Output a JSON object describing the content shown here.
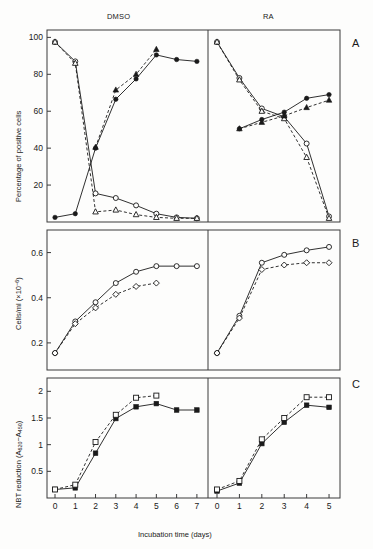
{
  "figure": {
    "columns": [
      {
        "id": "dmso",
        "label": "DMSO"
      },
      {
        "id": "ra",
        "label": "RA"
      }
    ],
    "panel_letters": [
      "A",
      "B",
      "C"
    ],
    "xlabel": "Incubation time (days)",
    "panels": [
      {
        "letter": "A",
        "ylabel": "Percentage of positive cells",
        "yticks": [
          20,
          40,
          60,
          80,
          100
        ]
      },
      {
        "letter": "B",
        "ylabel_main": "Cells/ml",
        "ylabel_unit_base": "(×10",
        "ylabel_unit_exp": "−6",
        "ylabel_unit_close": ")",
        "yticks": [
          0.2,
          0.4,
          0.6
        ]
      },
      {
        "letter": "C",
        "ylabel_main": "NBT reduction (A",
        "ylabel_sub1": "620",
        "ylabel_mid": "−A",
        "ylabel_sub2": "450",
        "ylabel_close": ")",
        "yticks": [
          0.5,
          1.0,
          1.5,
          2.0
        ]
      }
    ]
  },
  "chart_data": [
    {
      "id": "panel-a-dmso",
      "type": "line",
      "title": "DMSO",
      "panel": "A",
      "xlabel": "Incubation time (days)",
      "ylabel": "Percentage of positive cells",
      "xlim": [
        0,
        7.4
      ],
      "ylim": [
        0,
        104
      ],
      "xticks": [
        0,
        1,
        2,
        3,
        4,
        5,
        6,
        7
      ],
      "yticks": [
        20,
        40,
        60,
        80,
        100
      ],
      "grid": false,
      "legend": "none",
      "series": [
        {
          "name": "open-circle-descending",
          "marker": "open-circle",
          "line": "solid",
          "x": [
            0,
            1,
            2,
            3,
            4,
            5,
            6,
            7
          ],
          "y": [
            97.5,
            87,
            15.5,
            13,
            9,
            4.5,
            2.5,
            2
          ]
        },
        {
          "name": "open-triangle-descending",
          "marker": "open-triangle",
          "line": "dashed",
          "x": [
            0,
            1,
            2,
            3,
            4,
            5,
            6,
            7
          ],
          "y": [
            97.5,
            86,
            5.5,
            6.5,
            4,
            2.5,
            2,
            2
          ]
        },
        {
          "name": "filled-circle-ascending",
          "marker": "filled-circle",
          "line": "solid",
          "x": [
            0,
            1,
            2,
            3,
            4,
            5,
            6,
            7
          ],
          "y": [
            2.5,
            4.5,
            40,
            66.5,
            77.5,
            90.5,
            88,
            87
          ]
        },
        {
          "name": "filled-triangle-ascending",
          "marker": "filled-triangle",
          "line": "dashed",
          "x": [
            2,
            3,
            4,
            5
          ],
          "y": [
            40.5,
            71.5,
            80,
            93.5
          ]
        }
      ]
    },
    {
      "id": "panel-a-ra",
      "type": "line",
      "title": "RA",
      "panel": "A",
      "xlabel": "Incubation time (days)",
      "ylabel": "Percentage of positive cells",
      "xlim": [
        0,
        5.4
      ],
      "ylim": [
        0,
        104
      ],
      "xticks": [
        0,
        1,
        2,
        3,
        4,
        5
      ],
      "yticks": [
        20,
        40,
        60,
        80,
        100
      ],
      "grid": false,
      "legend": "none",
      "series": [
        {
          "name": "open-circle-descending",
          "marker": "open-circle",
          "line": "solid",
          "x": [
            0,
            1,
            2,
            3,
            4,
            5
          ],
          "y": [
            97.5,
            78,
            61.5,
            57,
            42.5,
            3
          ]
        },
        {
          "name": "open-triangle-descending",
          "marker": "open-triangle",
          "line": "dashed",
          "x": [
            0,
            1,
            2,
            3,
            4,
            5
          ],
          "y": [
            97.5,
            77,
            60,
            56,
            35,
            2
          ]
        },
        {
          "name": "filled-circle-ascending",
          "marker": "filled-circle",
          "line": "solid",
          "x": [
            1,
            2,
            3,
            4,
            5
          ],
          "y": [
            50.5,
            55.5,
            59.5,
            67,
            69
          ]
        },
        {
          "name": "filled-triangle-ascending",
          "marker": "filled-triangle",
          "line": "dashed",
          "x": [
            1,
            2,
            3,
            4,
            5
          ],
          "y": [
            50.5,
            54,
            57.5,
            62,
            66
          ]
        }
      ]
    },
    {
      "id": "panel-b-dmso",
      "type": "line",
      "title": "DMSO",
      "panel": "B",
      "xlabel": "Incubation time (days)",
      "ylabel": "Cells/ml (×10−6)",
      "xlim": [
        0,
        7.4
      ],
      "ylim": [
        0.08,
        0.7
      ],
      "xticks": [
        0,
        1,
        2,
        3,
        4,
        5,
        6,
        7
      ],
      "yticks": [
        0.2,
        0.4,
        0.6
      ],
      "grid": false,
      "legend": "none",
      "series": [
        {
          "name": "open-circle",
          "marker": "open-circle",
          "line": "solid",
          "x": [
            0,
            1,
            2,
            3,
            4,
            5,
            6,
            7
          ],
          "y": [
            0.155,
            0.295,
            0.38,
            0.465,
            0.515,
            0.54,
            0.54,
            0.54
          ]
        },
        {
          "name": "open-diamond",
          "marker": "open-diamond",
          "line": "dashed",
          "x": [
            0,
            1,
            2,
            3,
            4,
            5
          ],
          "y": [
            0.155,
            0.285,
            0.355,
            0.415,
            0.45,
            0.465
          ]
        }
      ]
    },
    {
      "id": "panel-b-ra",
      "type": "line",
      "title": "RA",
      "panel": "B",
      "xlabel": "Incubation time (days)",
      "ylabel": "Cells/ml (×10−6)",
      "xlim": [
        0,
        5.4
      ],
      "ylim": [
        0.08,
        0.7
      ],
      "xticks": [
        0,
        1,
        2,
        3,
        4,
        5
      ],
      "yticks": [
        0.2,
        0.4,
        0.6
      ],
      "grid": false,
      "legend": "none",
      "series": [
        {
          "name": "open-circle",
          "marker": "open-circle",
          "line": "solid",
          "x": [
            0,
            1,
            2,
            3,
            4,
            5
          ],
          "y": [
            0.155,
            0.32,
            0.555,
            0.59,
            0.61,
            0.625
          ]
        },
        {
          "name": "open-diamond",
          "marker": "open-diamond",
          "line": "dashed",
          "x": [
            0,
            1,
            2,
            3,
            4,
            5
          ],
          "y": [
            0.155,
            0.31,
            0.525,
            0.545,
            0.555,
            0.555
          ]
        }
      ]
    },
    {
      "id": "panel-c-dmso",
      "type": "line",
      "title": "DMSO",
      "panel": "C",
      "xlabel": "Incubation time (days)",
      "ylabel": "NBT reduction (A620−A450)",
      "xlim": [
        0,
        7.4
      ],
      "ylim": [
        0,
        2.25
      ],
      "xticks": [
        0,
        1,
        2,
        3,
        4,
        5,
        6,
        7
      ],
      "yticks": [
        0.5,
        1.0,
        1.5,
        2.0
      ],
      "grid": false,
      "legend": "none",
      "series": [
        {
          "name": "filled-square",
          "marker": "filled-square",
          "line": "solid",
          "x": [
            0,
            1,
            2,
            3,
            4,
            5,
            6,
            7
          ],
          "y": [
            0.16,
            0.19,
            0.84,
            1.49,
            1.71,
            1.77,
            1.65,
            1.65
          ]
        },
        {
          "name": "open-square",
          "marker": "open-square",
          "line": "dashed",
          "x": [
            0,
            1,
            2,
            3,
            4,
            5
          ],
          "y": [
            0.16,
            0.25,
            1.05,
            1.56,
            1.88,
            1.92
          ]
        }
      ]
    },
    {
      "id": "panel-c-ra",
      "type": "line",
      "title": "RA",
      "panel": "C",
      "xlabel": "Incubation time (days)",
      "ylabel": "NBT reduction (A620−A450)",
      "xlim": [
        0,
        5.4
      ],
      "ylim": [
        0,
        2.25
      ],
      "xticks": [
        0,
        1,
        2,
        3,
        4,
        5
      ],
      "yticks": [
        0.5,
        1.0,
        1.5,
        2.0
      ],
      "grid": false,
      "legend": "none",
      "series": [
        {
          "name": "filled-square",
          "marker": "filled-square",
          "line": "solid",
          "x": [
            0,
            1,
            2,
            3,
            4,
            5
          ],
          "y": [
            0.13,
            0.28,
            1.02,
            1.42,
            1.74,
            1.7
          ]
        },
        {
          "name": "open-square",
          "marker": "open-square",
          "line": "dashed",
          "x": [
            0,
            1,
            2,
            3,
            4,
            5
          ],
          "y": [
            0.16,
            0.32,
            1.1,
            1.5,
            1.89,
            1.89
          ]
        }
      ]
    }
  ],
  "colors": {
    "ink": "#1a1a1a",
    "frame": "#3a3a3a",
    "background": "#fdfdfc"
  }
}
